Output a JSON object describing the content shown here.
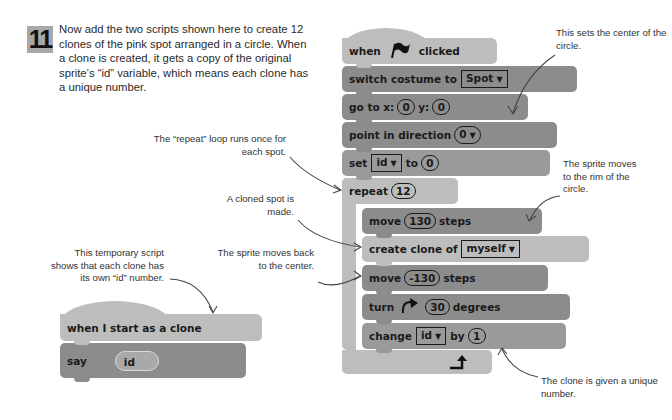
{
  "step": {
    "number": "11",
    "text": "Now add the two scripts shown here to create 12 clones of the pink spot arranged in a circle. When a clone is created, it gets a copy of the original sprite’s “id” variable, which means each clone has a unique number."
  },
  "main_script": {
    "hat": {
      "before": "when",
      "icon": "green-flag-icon",
      "after": "clicked"
    },
    "switch_costume": {
      "label": "switch costume to",
      "value": "Spot"
    },
    "go_to": {
      "label_x": "go to x:",
      "x": "0",
      "label_y": "y:",
      "y": "0"
    },
    "point_direction": {
      "label": "point in direction",
      "value": "0"
    },
    "set_var": {
      "label": "set",
      "var": "id",
      "to_label": "to",
      "value": "0"
    },
    "repeat": {
      "label": "repeat",
      "count": "12"
    },
    "move_out": {
      "label": "move",
      "value": "130",
      "suffix": "steps"
    },
    "create_clone": {
      "label": "create clone of",
      "value": "myself"
    },
    "move_back": {
      "label": "move",
      "value": "-130",
      "suffix": "steps"
    },
    "turn": {
      "label": "turn",
      "value": "30",
      "suffix": "degrees"
    },
    "change_var": {
      "label": "change",
      "var": "id",
      "by_label": "by",
      "value": "1"
    }
  },
  "clone_script": {
    "hat": "when I start as a clone",
    "say": {
      "label": "say",
      "value": "id"
    }
  },
  "annotations": {
    "center": "This sets the center of the circle.",
    "repeat": "The “repeat” loop runs once for each spot.",
    "clone": "A cloned spot is made.",
    "rim": "The sprite moves to the rim of the circle.",
    "temp": "This temporary script shows that each clone has its own “id” number.",
    "back": "The sprite moves back to the center.",
    "unique": "The clone is given a unique number."
  }
}
